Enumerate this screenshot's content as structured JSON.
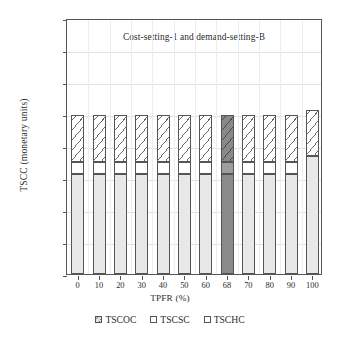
{
  "chart_data": {
    "type": "bar",
    "title": "Cost-setting-1 and demand-setting-B",
    "xlabel": "TPFR (%)",
    "ylabel": "TSCC (monetary units)",
    "categories": [
      "0",
      "10",
      "20",
      "30",
      "40",
      "50",
      "60",
      "68",
      "70",
      "80",
      "90",
      "100"
    ],
    "series": [
      {
        "name": "TSCOC",
        "values": [
          15700,
          15700,
          15700,
          15700,
          15700,
          15700,
          15700,
          15700,
          15700,
          15700,
          15700,
          18400
        ]
      },
      {
        "name": "TSCSC",
        "values": [
          1800,
          1800,
          1800,
          1800,
          1800,
          1800,
          1800,
          1800,
          1800,
          1800,
          1800,
          0
        ]
      },
      {
        "name": "TSCHC",
        "values": [
          7300,
          7300,
          7300,
          7300,
          7300,
          7300,
          7300,
          7300,
          7300,
          7300,
          7300,
          7300
        ]
      }
    ],
    "totals": [
      24800,
      24800,
      24800,
      24800,
      24800,
      24800,
      24800,
      24800,
      24800,
      24800,
      24800,
      25700
    ],
    "highlighted_category": "68",
    "highlight_color": "#8a8a8a",
    "stacked": true,
    "ylim": [
      0,
      40000
    ],
    "yticks": [
      "0",
      "5000",
      "10,000",
      "15,000",
      "20,000",
      "25,000",
      "30,000",
      "35,000",
      "40,000"
    ],
    "ytick_values": [
      0,
      5000,
      10000,
      15000,
      20000,
      25000,
      30000,
      35000,
      40000
    ],
    "grid": true,
    "legend_position": "bottom",
    "legend": [
      {
        "label": "TSCOC",
        "swatch": "hatched-light-square"
      },
      {
        "label": "TSCSC",
        "swatch": "white-square"
      },
      {
        "label": "TSCHC",
        "swatch": "white-square"
      }
    ]
  }
}
